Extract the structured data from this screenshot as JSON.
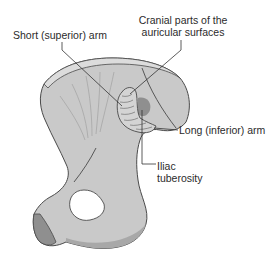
{
  "figure": {
    "colors": {
      "bone_fill": "#c9c9c9",
      "bone_highlight": "#dcdcdc",
      "bone_shadow": "#a8a8a8",
      "outline": "#4a4a4a",
      "leader_line": "#333333",
      "tuberosity_shade": "#8f8f8f",
      "text": "#2b2b2b",
      "background": "#ffffff"
    }
  },
  "labels": {
    "short_arm": "Short (superior) arm",
    "cranial_line1": "Cranial parts of the",
    "cranial_line2": "auricular surfaces",
    "long_arm": "Long (inferior) arm",
    "iliac_line1": "Iliac",
    "iliac_line2": "tuberosity"
  }
}
